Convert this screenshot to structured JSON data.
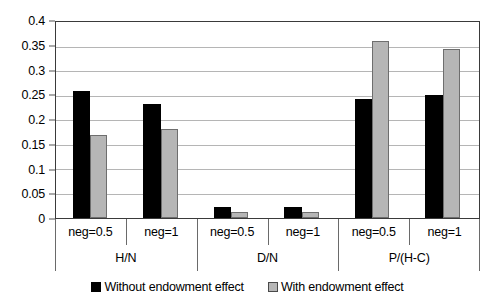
{
  "chart_data": {
    "type": "bar",
    "title": "",
    "xlabel": "",
    "ylabel": "",
    "ylim": [
      0,
      0.4
    ],
    "yticks": [
      "0",
      "0.05",
      "0.1",
      "0.15",
      "0.2",
      "0.25",
      "0.3",
      "0.35",
      "0.4"
    ],
    "ytick_values": [
      0,
      0.05,
      0.1,
      0.15,
      0.2,
      0.25,
      0.3,
      0.35,
      0.4
    ],
    "grid": true,
    "legend_position": "bottom",
    "groups": [
      "H/N",
      "D/N",
      "P/(H-C)"
    ],
    "subcategories": [
      "neg=0.5",
      "neg=1"
    ],
    "categories": [
      "H/N neg=0.5",
      "H/N neg=1",
      "D/N neg=0.5",
      "D/N neg=1",
      "P/(H-C) neg=0.5",
      "P/(H-C) neg=1"
    ],
    "series": [
      {
        "name": "Without endowment effect",
        "color": "#000000",
        "values": [
          0.259,
          0.232,
          0.022,
          0.023,
          0.243,
          0.252
        ]
      },
      {
        "name": "With endowment effect",
        "color": "#b6b6b6",
        "values": [
          0.169,
          0.181,
          0.012,
          0.012,
          0.361,
          0.344
        ]
      }
    ]
  },
  "axis": {
    "y_ticks": [
      {
        "label": "0.4",
        "value": 0.4
      },
      {
        "label": "0.35",
        "value": 0.35
      },
      {
        "label": "0.3",
        "value": 0.3
      },
      {
        "label": "0.25",
        "value": 0.25
      },
      {
        "label": "0.2",
        "value": 0.2
      },
      {
        "label": "0.15",
        "value": 0.15
      },
      {
        "label": "0.1",
        "value": 0.1
      },
      {
        "label": "0.05",
        "value": 0.05
      },
      {
        "label": "0",
        "value": 0
      }
    ],
    "x_groups": [
      {
        "label": "H/N",
        "subs": [
          "neg=0.5",
          "neg=1"
        ]
      },
      {
        "label": "D/N",
        "subs": [
          "neg=0.5",
          "neg=1"
        ]
      },
      {
        "label": "P/(H-C)",
        "subs": [
          "neg=0.5",
          "neg=1"
        ]
      }
    ]
  },
  "legend": {
    "items": [
      {
        "label": "Without endowment effect",
        "color": "#000000"
      },
      {
        "label": "With endowment effect",
        "color": "#b6b6b6"
      }
    ]
  }
}
